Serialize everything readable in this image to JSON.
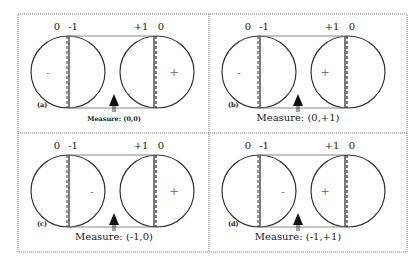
{
  "figure": {
    "frame": {
      "x": 18,
      "y": 14,
      "w": 389,
      "h": 238,
      "mid_x": 209,
      "mid_y": 133
    },
    "colors": {
      "line": "#333333",
      "frame": "#777777",
      "rect": "#888888",
      "sign": "#777777"
    },
    "panels": [
      {
        "id": "a",
        "label": "(a)",
        "ox": 18,
        "oy": 14,
        "top_labels": {
          "left_zero": "0",
          "left_inner": "-1",
          "right_inner": "+1",
          "right_zero": "0"
        },
        "left_sign": "-",
        "left_sign_pos": "outer",
        "right_sign": "+",
        "right_sign_pos": "outer",
        "measure_text": "Measure: (0,0)",
        "measure_small": true
      },
      {
        "id": "b",
        "label": "(b)",
        "ox": 209,
        "oy": 14,
        "top_labels": {
          "left_zero": "0",
          "left_inner": "-1",
          "right_inner": "+1",
          "right_zero": "0"
        },
        "left_sign": "-",
        "left_sign_pos": "outer",
        "right_sign": "+",
        "right_sign_pos": "inner",
        "measure_text": "Measure: (0,+1)",
        "measure_small": false
      },
      {
        "id": "c",
        "label": "(c)",
        "ox": 18,
        "oy": 133,
        "top_labels": {
          "left_zero": "0",
          "left_inner": "-1",
          "right_inner": "+1",
          "right_zero": "0"
        },
        "left_sign": "-",
        "left_sign_pos": "inner",
        "right_sign": "+",
        "right_sign_pos": "outer",
        "measure_text": "Measure: (-1,0)",
        "measure_small": false
      },
      {
        "id": "d",
        "label": "(d)",
        "ox": 209,
        "oy": 133,
        "top_labels": {
          "left_zero": "0",
          "left_inner": "-1",
          "right_inner": "+1",
          "right_zero": "0"
        },
        "left_sign": "-",
        "left_sign_pos": "inner",
        "right_sign": "+",
        "right_sign_pos": "inner",
        "measure_text": "Measure: (-1,+1)",
        "measure_small": false
      }
    ]
  }
}
